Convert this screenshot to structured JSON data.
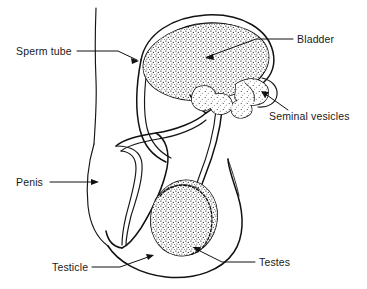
{
  "figure": {
    "background_color": "#ffffff",
    "ink_color": "#111111",
    "width": 367,
    "height": 289
  },
  "labels": [
    {
      "id": "sperm-tube",
      "text": "Sperm tube",
      "text_x": 16,
      "text_y": 55,
      "anchor": "start",
      "leader": "M 77 51 L 118 51 L 137 60",
      "arrow_x": 139,
      "arrow_y": 61,
      "arrow_angle": 26
    },
    {
      "id": "bladder",
      "text": "Bladder",
      "text_x": 297,
      "text_y": 43,
      "anchor": "start",
      "leader": "M 293 39 L 256 39 L 207 57",
      "arrow_x": 205,
      "arrow_y": 58,
      "arrow_angle": 200
    },
    {
      "id": "seminal-vesicles",
      "text": "Seminal vesicles",
      "text_x": 269,
      "text_y": 120,
      "anchor": "start",
      "leader": "M 288 110 L 264 93",
      "arrow_x": 261,
      "arrow_y": 91,
      "arrow_angle": 215
    },
    {
      "id": "penis",
      "text": "Penis",
      "text_x": 16,
      "text_y": 186,
      "anchor": "start",
      "leader": "M 50 182 L 96 182",
      "arrow_x": 99,
      "arrow_y": 182,
      "arrow_angle": 0
    },
    {
      "id": "testicle",
      "text": "Testicle",
      "text_x": 52,
      "text_y": 271,
      "anchor": "start",
      "leader": "M 92 267 L 120 267 L 151 256",
      "arrow_x": 154,
      "arrow_y": 255,
      "arrow_angle": -20
    },
    {
      "id": "testes",
      "text": "Testes",
      "text_x": 259,
      "text_y": 266,
      "anchor": "start",
      "leader": "M 255 262 L 222 262 L 196 249",
      "arrow_x": 193,
      "arrow_y": 247,
      "arrow_angle": 207
    }
  ],
  "structures": [
    {
      "id": "body-wall",
      "name": "body outline"
    },
    {
      "id": "bladder",
      "name": "Bladder"
    },
    {
      "id": "sperm-tube",
      "name": "Sperm tube (vas deferens)"
    },
    {
      "id": "seminal-vesicles",
      "name": "Seminal vesicles"
    },
    {
      "id": "prostate",
      "name": "Prostate lobes"
    },
    {
      "id": "urethra",
      "name": "Urethra"
    },
    {
      "id": "penis",
      "name": "Penis"
    },
    {
      "id": "scrotum",
      "name": "Scrotum"
    },
    {
      "id": "testis",
      "name": "Testis"
    },
    {
      "id": "epididymis",
      "name": "Epididymis"
    }
  ]
}
